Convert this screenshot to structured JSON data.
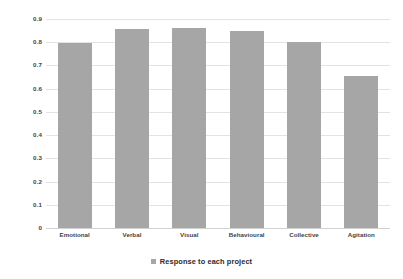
{
  "chart_data": {
    "type": "bar",
    "title": "",
    "subtitle": "",
    "xlabel": "",
    "ylabel": "",
    "categories": [
      "Emotional",
      "Verbal",
      "Visual",
      "Behavioural",
      "Collective",
      "Agitation"
    ],
    "values": [
      0.795,
      0.855,
      0.862,
      0.848,
      0.802,
      0.653
    ],
    "series": [
      {
        "name": "Response to each project",
        "values": [
          0.795,
          0.855,
          0.862,
          0.848,
          0.802,
          0.653
        ],
        "color": "#a6a6a6"
      }
    ],
    "ylim": [
      0,
      0.9
    ],
    "ytick_labels": [
      "0.9",
      "0.8",
      "0.7",
      "0.6",
      "0.5",
      "0.4",
      "0.3",
      "0.2",
      "0.1",
      "0"
    ],
    "ytick_values": [
      0.9,
      0.8,
      0.7,
      0.6,
      0.5,
      0.4,
      0.3,
      0.2,
      0.1,
      0
    ],
    "grid": true,
    "grid_color": "#e3e3e3",
    "legend_position": "bottom-center",
    "legend": [
      {
        "label": "Response to each project",
        "color": "#a6a6a6",
        "marker": "square"
      }
    ],
    "bar_color": "#a6a6a6",
    "background": "#ffffff",
    "text_color": "#3f3f3f"
  }
}
